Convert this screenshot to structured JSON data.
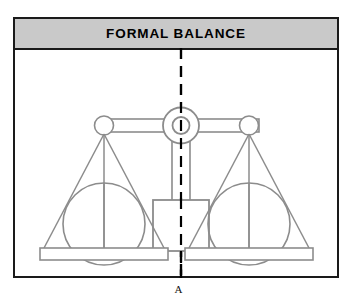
{
  "figure": {
    "title": "FORMAL BALANCE",
    "caption": "A",
    "colors": {
      "header_fill": "#c9c9c9",
      "frame_border": "#1a1a1a",
      "drawing_stroke": "#8c8c8c",
      "axis_line": "#000000",
      "background": "#ffffff",
      "title_text": "#000000"
    }
  },
  "diagram": {
    "type": "balance-scale",
    "elements": {
      "center_axis": "vertical-dashed-line",
      "fulcrum": "concentric-circles-hub",
      "beam": "horizontal-double-line-beam",
      "left_pan": "triangular-pan-with-circle",
      "right_pan": "triangular-pan-with-circle",
      "center_weight": "square-box",
      "stem": "vertical-column"
    },
    "symmetry": "bilateral",
    "axis_label": "A"
  }
}
